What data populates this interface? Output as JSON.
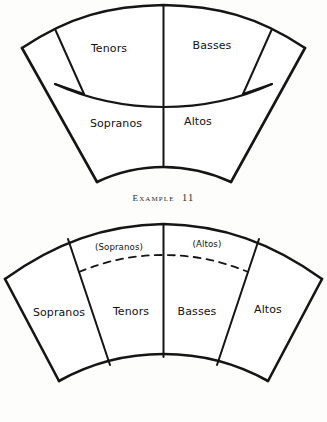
{
  "document": {
    "title": "Choir Seating Arrangement Diagrams",
    "background_color": "#fdfdfc",
    "ink_color": "#151515"
  },
  "figures": [
    {
      "id": "example-11",
      "caption": "Example 11",
      "caption_prefix": "E",
      "caption_rest": "xample",
      "caption_number": "11",
      "layout": "two-row fan, four voice blocks",
      "sections": [
        {
          "name": "tenors",
          "label": "Tenors",
          "row": "back",
          "side": "left"
        },
        {
          "name": "basses",
          "label": "Basses",
          "row": "back",
          "side": "right"
        },
        {
          "name": "sopranos",
          "label": "Sopranos",
          "row": "front",
          "side": "left"
        },
        {
          "name": "altos",
          "label": "Altos",
          "row": "front",
          "side": "right"
        }
      ]
    },
    {
      "id": "example-12",
      "caption": "Example 12",
      "caption_prefix": "E",
      "caption_rest": "xample",
      "caption_number": "12",
      "layout": "single-row fan, four radial wedges with dashed rear arc",
      "sections": [
        {
          "name": "sopranos",
          "label": "Sopranos",
          "order": 1
        },
        {
          "name": "tenors",
          "label": "Tenors",
          "order": 2
        },
        {
          "name": "basses",
          "label": "Basses",
          "order": 3
        },
        {
          "name": "altos",
          "label": "Altos",
          "order": 4
        }
      ],
      "rear_annotations": [
        {
          "name": "sopranos-parenthetical",
          "label": "(Sopranos)",
          "side": "left"
        },
        {
          "name": "altos-parenthetical",
          "label": "(Altos)",
          "side": "right"
        }
      ]
    }
  ]
}
